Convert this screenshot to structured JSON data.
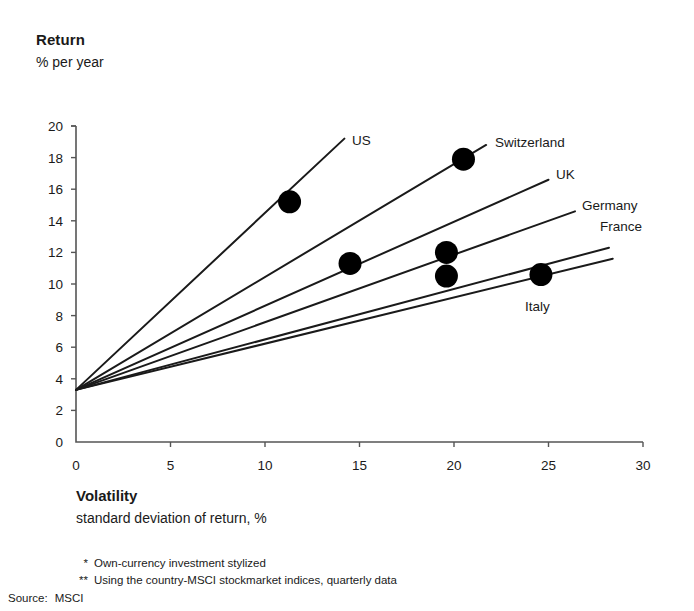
{
  "axis_titles": {
    "y_main": "Return",
    "y_sub": "% per year",
    "x_main": "Volatility",
    "x_sub": "standard deviation of return,   %"
  },
  "footnotes": [
    {
      "marker": "*",
      "text": "Own-currency investment stylized"
    },
    {
      "marker": "**",
      "text": "Using the country-MSCI stockmarket indices, quarterly data"
    }
  ],
  "source": {
    "label": "Source:",
    "value": "MSCI"
  },
  "colors": {
    "ink": "#1a1a1a",
    "axis": "#555555",
    "marker": "#000000",
    "background": "#ffffff"
  },
  "chart_data": {
    "type": "scatter",
    "title": "",
    "xlabel": "Volatility",
    "ylabel": "Return",
    "xlim": [
      0,
      30
    ],
    "ylim": [
      0,
      20
    ],
    "xticks": [
      0,
      5,
      10,
      15,
      20,
      25,
      30
    ],
    "yticks": [
      0,
      2,
      4,
      6,
      8,
      10,
      12,
      14,
      16,
      18,
      20
    ],
    "grid": false,
    "legend": "inline-labels-at-line-ends",
    "risk_free_rate": 3.3,
    "points": [
      {
        "name": "US",
        "x": 11.3,
        "y": 15.2
      },
      {
        "name": "Switzerland",
        "x": 20.5,
        "y": 17.9
      },
      {
        "name": "UK",
        "x": 14.5,
        "y": 11.3
      },
      {
        "name": "Germany",
        "x": 19.6,
        "y": 12.0
      },
      {
        "name": "France",
        "x": 19.6,
        "y": 10.5
      },
      {
        "name": "Italy",
        "x": 24.6,
        "y": 10.6
      }
    ],
    "lines": [
      {
        "name": "US",
        "x0": 0,
        "y0": 3.3,
        "x1": 14.2,
        "y1": 19.2
      },
      {
        "name": "Switzerland",
        "x0": 0,
        "y0": 3.3,
        "x1": 21.7,
        "y1": 18.8
      },
      {
        "name": "UK",
        "x0": 0,
        "y0": 3.3,
        "x1": 25.0,
        "y1": 16.6
      },
      {
        "name": "Germany",
        "x0": 0,
        "y0": 3.3,
        "x1": 26.4,
        "y1": 14.6
      },
      {
        "name": "France",
        "x0": 0,
        "y0": 3.3,
        "x1": 28.2,
        "y1": 12.3
      },
      {
        "name": "Italy",
        "x0": 0,
        "y0": 3.3,
        "x1": 28.4,
        "y1": 11.6
      }
    ],
    "series_labels": [
      {
        "name": "US",
        "text": "US",
        "px": 352,
        "py": 145
      },
      {
        "name": "Switzerland",
        "text": "Switzerland",
        "px": 495,
        "py": 147
      },
      {
        "name": "UK",
        "text": "UK",
        "px": 556,
        "py": 179
      },
      {
        "name": "Germany",
        "text": "Germany",
        "px": 582,
        "py": 210
      },
      {
        "name": "France",
        "text": "France",
        "px": 600,
        "py": 231
      },
      {
        "name": "Italy",
        "text": "Italy",
        "px": 525,
        "py": 311
      }
    ]
  }
}
